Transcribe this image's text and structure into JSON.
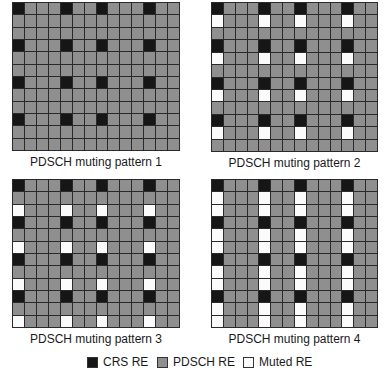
{
  "colors": {
    "crs": "#161616",
    "pdsch": "#8f8f8f",
    "muted": "#fbfbfb",
    "grid_line": "#2a2a2a"
  },
  "grid": {
    "rows": 12,
    "cols": 14,
    "crs_cols": [
      0,
      4,
      7,
      11
    ],
    "crs_rows": [
      0,
      3,
      6,
      9
    ]
  },
  "patterns": [
    {
      "caption": "PDSCH muting pattern 1",
      "muted_rows": []
    },
    {
      "caption": "PDSCH muting pattern 2",
      "muted_rows": [
        1,
        4,
        7,
        10
      ]
    },
    {
      "caption": "PDSCH muting pattern 3",
      "muted_rows": [
        2,
        5,
        8,
        11
      ]
    },
    {
      "caption": "PDSCH muting pattern 4",
      "muted_rows": [
        1,
        2,
        4,
        5,
        7,
        8,
        10,
        11
      ]
    }
  ],
  "legend": [
    {
      "label": "CRS RE",
      "kind": "crs"
    },
    {
      "label": "PDSCH RE",
      "kind": "pdsch"
    },
    {
      "label": "Muted RE",
      "kind": "muted"
    }
  ]
}
